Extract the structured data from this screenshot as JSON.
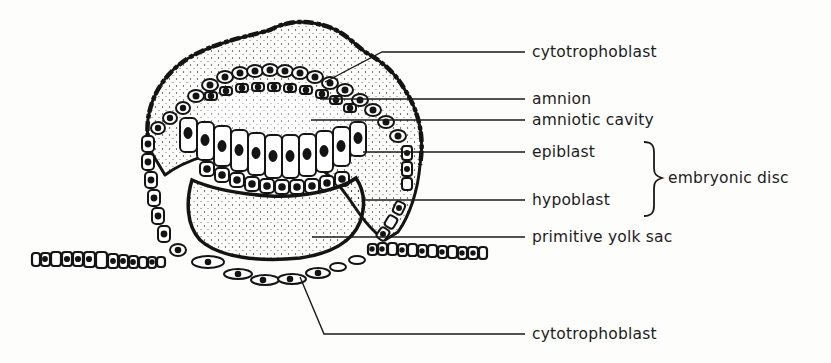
{
  "figure": {
    "colors": {
      "ink": "#141414",
      "paper": "#fdfdfc",
      "stipple": "#2a2a2a"
    }
  },
  "labels": [
    {
      "id": "cytotrophoblast-top",
      "text": "cytotrophoblast",
      "x": 532,
      "y": 43
    },
    {
      "id": "amnion",
      "text": "amnion",
      "x": 532,
      "y": 91
    },
    {
      "id": "amniotic-cavity",
      "text": "amniotic cavity",
      "x": 532,
      "y": 114
    },
    {
      "id": "epiblast",
      "text": "epiblast",
      "x": 532,
      "y": 145
    },
    {
      "id": "hypoblast",
      "text": "hypoblast",
      "x": 532,
      "y": 194
    },
    {
      "id": "primitive-yolk-sac",
      "text": "primitive yolk sac",
      "x": 532,
      "y": 230
    },
    {
      "id": "cytotrophoblast-bottom",
      "text": "cytotrophoblast",
      "x": 532,
      "y": 327
    }
  ],
  "group_label": {
    "text": "embryonic disc",
    "groups": [
      "epiblast",
      "hypoblast"
    ],
    "x": 668,
    "y": 172
  }
}
